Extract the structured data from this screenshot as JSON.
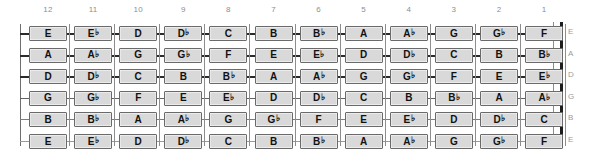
{
  "diagram": {
    "orientation": "frets descending left to right",
    "box_fill_color": "#d9d9d9",
    "box_border_color": "#6a6a6a",
    "label_color": "#9b9b9b",
    "string_color": "#2b2b2b"
  },
  "fret_numbers": [
    "12",
    "11",
    "10",
    "9",
    "8",
    "7",
    "6",
    "5",
    "4",
    "3",
    "2",
    "1"
  ],
  "string_labels": [
    "E",
    "A",
    "D",
    "G",
    "B",
    "E"
  ],
  "chart_data": {
    "type": "table",
    "xlabel": "Fret",
    "ylabel": "String",
    "categories": [
      "12",
      "11",
      "10",
      "9",
      "8",
      "7",
      "6",
      "5",
      "4",
      "3",
      "2",
      "1"
    ],
    "row_labels": [
      "E",
      "A",
      "D",
      "G",
      "B",
      "E"
    ],
    "series": [
      {
        "name": "E",
        "values": [
          "E",
          "E♭",
          "D",
          "D♭",
          "C",
          "B",
          "B♭",
          "A",
          "A♭",
          "G",
          "G♭",
          "F"
        ]
      },
      {
        "name": "A",
        "values": [
          "A",
          "A♭",
          "G",
          "G♭",
          "F",
          "E",
          "E♭",
          "D",
          "D♭",
          "C",
          "B",
          "B♭"
        ]
      },
      {
        "name": "D",
        "values": [
          "D",
          "D♭",
          "C",
          "B",
          "B♭",
          "A",
          "A♭",
          "G",
          "G♭",
          "F",
          "E",
          "E♭"
        ]
      },
      {
        "name": "G",
        "values": [
          "G",
          "G♭",
          "F",
          "E",
          "E♭",
          "D",
          "D♭",
          "C",
          "B",
          "B♭",
          "A",
          "A♭"
        ]
      },
      {
        "name": "B",
        "values": [
          "B",
          "B♭",
          "A",
          "A♭",
          "G",
          "G♭",
          "F",
          "E",
          "E♭",
          "D",
          "D♭",
          "C"
        ]
      },
      {
        "name": "E",
        "values": [
          "E",
          "E♭",
          "D",
          "D♭",
          "C",
          "B",
          "B♭",
          "A",
          "A♭",
          "G",
          "G♭",
          "F"
        ]
      }
    ]
  }
}
